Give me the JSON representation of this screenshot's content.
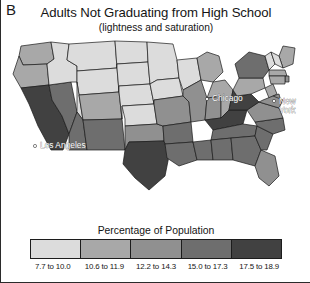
{
  "panel": {
    "label": "B"
  },
  "header": {
    "title": "Adults Not Graduating from High School",
    "subtitle": "(lightness and saturation)"
  },
  "legend": {
    "title": "Percentage of Population",
    "bins": [
      {
        "label": "7.7 to 10.0",
        "color": "#dcdcdc",
        "min": 7.7,
        "max": 10.0
      },
      {
        "label": "10.6 to 11.9",
        "color": "#a8a8a8",
        "min": 10.6,
        "max": 11.9
      },
      {
        "label": "12.2 to 14.3",
        "color": "#909090",
        "min": 12.2,
        "max": 14.3
      },
      {
        "label": "15.0 to 17.3",
        "color": "#6e6e6e",
        "min": 15.0,
        "max": 17.3
      },
      {
        "label": "17.5 to 18.9",
        "color": "#414141",
        "min": 17.5,
        "max": 18.9
      }
    ]
  },
  "cities": [
    {
      "name": "Chicago",
      "label_lines": [
        "Chicago"
      ],
      "x": 205,
      "y": 63,
      "dot_x": 200,
      "dot_y": 61
    },
    {
      "name": "New York",
      "label_lines": [
        "New",
        "York"
      ],
      "x": 272,
      "y": 66,
      "dot_x": 267,
      "dot_y": 63
    },
    {
      "name": "Los Angeles",
      "label_lines": [
        "Los Angeles"
      ],
      "x": 33,
      "y": 110,
      "dot_x": 28,
      "dot_y": 108
    }
  ],
  "chart_data": {
    "type": "map",
    "title": "Adults Not Graduating from High School",
    "subtitle": "(lightness and saturation)",
    "value_label": "Percentage of Population",
    "units": "percent",
    "color_scheme": "grayscale-sequential",
    "regions": [
      {
        "name": "Washington",
        "abbr": "WA",
        "bin": 1,
        "color": "#a8a8a8"
      },
      {
        "name": "Oregon",
        "abbr": "OR",
        "bin": 1,
        "color": "#a8a8a8"
      },
      {
        "name": "California",
        "abbr": "CA",
        "bin": 4,
        "color": "#414141"
      },
      {
        "name": "Nevada",
        "abbr": "NV",
        "bin": 3,
        "color": "#6e6e6e"
      },
      {
        "name": "Idaho",
        "abbr": "ID",
        "bin": 0,
        "color": "#dcdcdc"
      },
      {
        "name": "Montana",
        "abbr": "MT",
        "bin": 0,
        "color": "#dcdcdc"
      },
      {
        "name": "Wyoming",
        "abbr": "WY",
        "bin": 0,
        "color": "#dcdcdc"
      },
      {
        "name": "Utah",
        "abbr": "UT",
        "bin": 0,
        "color": "#dcdcdc"
      },
      {
        "name": "Arizona",
        "abbr": "AZ",
        "bin": 3,
        "color": "#6e6e6e"
      },
      {
        "name": "Colorado",
        "abbr": "CO",
        "bin": 1,
        "color": "#a8a8a8"
      },
      {
        "name": "New Mexico",
        "abbr": "NM",
        "bin": 3,
        "color": "#6e6e6e"
      },
      {
        "name": "North Dakota",
        "abbr": "ND",
        "bin": 0,
        "color": "#dcdcdc"
      },
      {
        "name": "South Dakota",
        "abbr": "SD",
        "bin": 0,
        "color": "#dcdcdc"
      },
      {
        "name": "Nebraska",
        "abbr": "NE",
        "bin": 0,
        "color": "#dcdcdc"
      },
      {
        "name": "Kansas",
        "abbr": "KS",
        "bin": 0,
        "color": "#dcdcdc"
      },
      {
        "name": "Oklahoma",
        "abbr": "OK",
        "bin": 2,
        "color": "#909090"
      },
      {
        "name": "Texas",
        "abbr": "TX",
        "bin": 4,
        "color": "#414141"
      },
      {
        "name": "Minnesota",
        "abbr": "MN",
        "bin": 0,
        "color": "#dcdcdc"
      },
      {
        "name": "Iowa",
        "abbr": "IA",
        "bin": 0,
        "color": "#dcdcdc"
      },
      {
        "name": "Missouri",
        "abbr": "MO",
        "bin": 2,
        "color": "#909090"
      },
      {
        "name": "Arkansas",
        "abbr": "AR",
        "bin": 3,
        "color": "#6e6e6e"
      },
      {
        "name": "Louisiana",
        "abbr": "LA",
        "bin": 3,
        "color": "#6e6e6e"
      },
      {
        "name": "Wisconsin",
        "abbr": "WI",
        "bin": 0,
        "color": "#dcdcdc"
      },
      {
        "name": "Illinois",
        "abbr": "IL",
        "bin": 2,
        "color": "#909090"
      },
      {
        "name": "Michigan",
        "abbr": "MI",
        "bin": 1,
        "color": "#a8a8a8"
      },
      {
        "name": "Indiana",
        "abbr": "IN",
        "bin": 2,
        "color": "#909090"
      },
      {
        "name": "Ohio",
        "abbr": "OH",
        "bin": 1,
        "color": "#a8a8a8"
      },
      {
        "name": "Kentucky",
        "abbr": "KY",
        "bin": 4,
        "color": "#414141"
      },
      {
        "name": "Tennessee",
        "abbr": "TN",
        "bin": 3,
        "color": "#6e6e6e"
      },
      {
        "name": "Mississippi",
        "abbr": "MS",
        "bin": 3,
        "color": "#6e6e6e"
      },
      {
        "name": "Alabama",
        "abbr": "AL",
        "bin": 3,
        "color": "#6e6e6e"
      },
      {
        "name": "Georgia",
        "abbr": "GA",
        "bin": 3,
        "color": "#6e6e6e"
      },
      {
        "name": "Florida",
        "abbr": "FL",
        "bin": 2,
        "color": "#909090"
      },
      {
        "name": "South Carolina",
        "abbr": "SC",
        "bin": 3,
        "color": "#6e6e6e"
      },
      {
        "name": "North Carolina",
        "abbr": "NC",
        "bin": 3,
        "color": "#6e6e6e"
      },
      {
        "name": "Virginia",
        "abbr": "VA",
        "bin": 2,
        "color": "#909090"
      },
      {
        "name": "West Virginia",
        "abbr": "WV",
        "bin": 4,
        "color": "#414141"
      },
      {
        "name": "Pennsylvania",
        "abbr": "PA",
        "bin": 1,
        "color": "#a8a8a8"
      },
      {
        "name": "New York",
        "abbr": "NY",
        "bin": 3,
        "color": "#6e6e6e"
      },
      {
        "name": "Maine",
        "abbr": "ME",
        "bin": 1,
        "color": "#a8a8a8"
      },
      {
        "name": "Vermont",
        "abbr": "VT",
        "bin": 0,
        "color": "#dcdcdc"
      },
      {
        "name": "New Hampshire",
        "abbr": "NH",
        "bin": 0,
        "color": "#dcdcdc"
      },
      {
        "name": "Massachusetts",
        "abbr": "MA",
        "bin": 1,
        "color": "#a8a8a8"
      },
      {
        "name": "Rhode Island",
        "abbr": "RI",
        "bin": 2,
        "color": "#909090"
      },
      {
        "name": "Connecticut",
        "abbr": "CT",
        "bin": 1,
        "color": "#a8a8a8"
      },
      {
        "name": "New Jersey",
        "abbr": "NJ",
        "bin": 1,
        "color": "#a8a8a8"
      },
      {
        "name": "Delaware",
        "abbr": "DE",
        "bin": 2,
        "color": "#909090"
      },
      {
        "name": "Maryland",
        "abbr": "MD",
        "bin": 2,
        "color": "#909090"
      }
    ]
  }
}
